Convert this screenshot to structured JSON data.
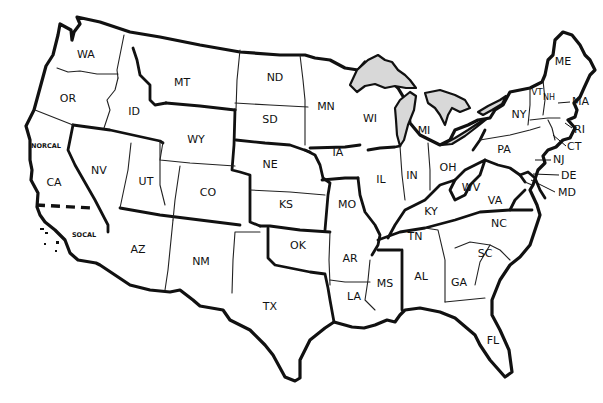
{
  "map": {
    "title": "",
    "background": "#ffffff",
    "line_color": "#111111",
    "lake_fill": "#d8d8d8",
    "states": [
      {
        "abbr": "WA",
        "x": 86,
        "y": 55
      },
      {
        "abbr": "OR",
        "x": 68,
        "y": 99
      },
      {
        "abbr": "ID",
        "x": 134,
        "y": 112
      },
      {
        "abbr": "MT",
        "x": 182,
        "y": 83
      },
      {
        "abbr": "WY",
        "x": 196,
        "y": 140
      },
      {
        "abbr": "NV",
        "x": 99,
        "y": 171
      },
      {
        "abbr": "UT",
        "x": 146,
        "y": 182
      },
      {
        "abbr": "CO",
        "x": 208,
        "y": 193
      },
      {
        "abbr": "CA",
        "x": 54,
        "y": 183
      },
      {
        "abbr": "AZ",
        "x": 138,
        "y": 250
      },
      {
        "abbr": "NM",
        "x": 201,
        "y": 262
      },
      {
        "abbr": "ND",
        "x": 275,
        "y": 78
      },
      {
        "abbr": "SD",
        "x": 270,
        "y": 120
      },
      {
        "abbr": "NE",
        "x": 270,
        "y": 165
      },
      {
        "abbr": "KS",
        "x": 286,
        "y": 205
      },
      {
        "abbr": "OK",
        "x": 298,
        "y": 246
      },
      {
        "abbr": "TX",
        "x": 270,
        "y": 307
      },
      {
        "abbr": "MN",
        "x": 326,
        "y": 107
      },
      {
        "abbr": "IA",
        "x": 338,
        "y": 153
      },
      {
        "abbr": "MO",
        "x": 347,
        "y": 205
      },
      {
        "abbr": "AR",
        "x": 350,
        "y": 259
      },
      {
        "abbr": "LA",
        "x": 354,
        "y": 297
      },
      {
        "abbr": "WI",
        "x": 370,
        "y": 119
      },
      {
        "abbr": "IL",
        "x": 381,
        "y": 180
      },
      {
        "abbr": "MI",
        "x": 424,
        "y": 131
      },
      {
        "abbr": "IN",
        "x": 412,
        "y": 176
      },
      {
        "abbr": "OH",
        "x": 448,
        "y": 168
      },
      {
        "abbr": "KY",
        "x": 431,
        "y": 212
      },
      {
        "abbr": "TN",
        "x": 415,
        "y": 237
      },
      {
        "abbr": "MS",
        "x": 385,
        "y": 284
      },
      {
        "abbr": "AL",
        "x": 421,
        "y": 277
      },
      {
        "abbr": "GA",
        "x": 459,
        "y": 283
      },
      {
        "abbr": "FL",
        "x": 493,
        "y": 341
      },
      {
        "abbr": "SC",
        "x": 485,
        "y": 254
      },
      {
        "abbr": "NC",
        "x": 499,
        "y": 224
      },
      {
        "abbr": "VA",
        "x": 495,
        "y": 201
      },
      {
        "abbr": "WV",
        "x": 471,
        "y": 188
      },
      {
        "abbr": "PA",
        "x": 504,
        "y": 150
      },
      {
        "abbr": "NY",
        "x": 519,
        "y": 115
      },
      {
        "abbr": "VT",
        "x": 537,
        "y": 92
      },
      {
        "abbr": "NH",
        "x": 549,
        "y": 97
      },
      {
        "abbr": "ME",
        "x": 563,
        "y": 62
      }
    ],
    "callouts": [
      {
        "abbr": "MA",
        "x": 572,
        "y": 102
      },
      {
        "abbr": "RI",
        "x": 574,
        "y": 130
      },
      {
        "abbr": "CT",
        "x": 567,
        "y": 147
      },
      {
        "abbr": "NJ",
        "x": 553,
        "y": 160
      },
      {
        "abbr": "DE",
        "x": 561,
        "y": 176
      },
      {
        "abbr": "MD",
        "x": 558,
        "y": 193
      }
    ],
    "regions": [
      {
        "label": "NORCAL",
        "x": 46,
        "y": 146
      },
      {
        "label": "SOCAL",
        "x": 84,
        "y": 235
      }
    ]
  }
}
